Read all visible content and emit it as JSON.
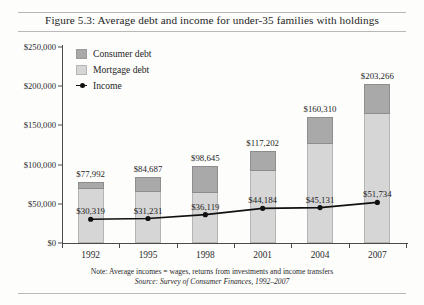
{
  "figure": {
    "title": "Figure 5.3: Average debt and income for under-35 families with holdings",
    "note": "Note: Average incomes = wages, returns from investments and income transfers",
    "source": "Source: Survey of Consumer Finances, 1992–2007"
  },
  "colors": {
    "consumer_debt": "#a9a9a9",
    "mortgage_debt": "#d6d6d6",
    "income_line": "#111111",
    "axis": "#4a4a4a"
  },
  "legend": {
    "position": "top-left-inside",
    "items": [
      {
        "key": "consumer",
        "label": "Consumer debt",
        "marker": "square-swatch"
      },
      {
        "key": "mortgage",
        "label": "Mortgage debt",
        "marker": "square-swatch"
      },
      {
        "key": "income",
        "label": "Income",
        "marker": "line-with-dot"
      }
    ]
  },
  "chart_data": {
    "type": "bar",
    "subtype": "stacked-bar-with-line-overlay",
    "title": "Figure 5.3: Average debt and income for under-35 families with holdings",
    "xlabel": "",
    "ylabel": "",
    "ylim": [
      0,
      250000
    ],
    "grid": false,
    "categories": [
      "1992",
      "1995",
      "1998",
      "2001",
      "2004",
      "2007"
    ],
    "ytick_labels": [
      "$0",
      "$50,000",
      "$100,000",
      "$150,000",
      "$200,000",
      "$250,000"
    ],
    "ytick_values": [
      0,
      50000,
      100000,
      150000,
      200000,
      250000
    ],
    "series": [
      {
        "name": "Mortgage debt",
        "type": "bar-segment",
        "stack": "debt",
        "values": [
          70000,
          66000,
          65000,
          93000,
          127000,
          166000
        ]
      },
      {
        "name": "Consumer debt",
        "type": "bar-segment",
        "stack": "debt",
        "values": [
          7992,
          18687,
          33645,
          24202,
          33310,
          37266
        ]
      },
      {
        "name": "Income",
        "type": "line",
        "values": [
          30319,
          31231,
          36119,
          44184,
          45131,
          51734
        ]
      }
    ],
    "bar_totals": {
      "name": "Total debt",
      "values": [
        77992,
        84687,
        98645,
        117202,
        160310,
        203266
      ],
      "labels": [
        "$77,992",
        "$84,687",
        "$98,645",
        "$117,202",
        "$160,310",
        "$203,266"
      ]
    },
    "income_labels": [
      "$30,319",
      "$31,231",
      "$36,119",
      "$44,184",
      "$45,131",
      "$51,734"
    ]
  }
}
